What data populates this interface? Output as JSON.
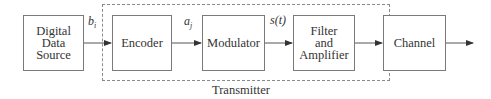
{
  "diagram": {
    "blocks": [
      {
        "id": "source",
        "label_lines": [
          "Digital",
          "Data",
          "Source"
        ]
      },
      {
        "id": "encoder",
        "label_lines": [
          "Encoder"
        ]
      },
      {
        "id": "modulator",
        "label_lines": [
          "Modulator"
        ]
      },
      {
        "id": "filter",
        "label_lines": [
          "Filter",
          "and",
          "Amplifier"
        ]
      },
      {
        "id": "channel",
        "label_lines": [
          "Channel"
        ]
      }
    ],
    "signals": {
      "b": {
        "base": "b",
        "sub": "i"
      },
      "a": {
        "base": "a",
        "sub": "j"
      },
      "s": "s(t)"
    },
    "group_label": "Transmitter",
    "edges": [
      {
        "from": "source",
        "to": "encoder",
        "label": "b_i"
      },
      {
        "from": "encoder",
        "to": "modulator",
        "label": "a_j"
      },
      {
        "from": "modulator",
        "to": "filter",
        "label": "s(t)"
      },
      {
        "from": "filter",
        "to": "channel",
        "label": ""
      },
      {
        "from": "channel",
        "to": "output",
        "label": ""
      }
    ],
    "colors": {
      "line": "#555555",
      "box_border": "#7a7a7a",
      "dashed": "#8a8a8a"
    }
  }
}
